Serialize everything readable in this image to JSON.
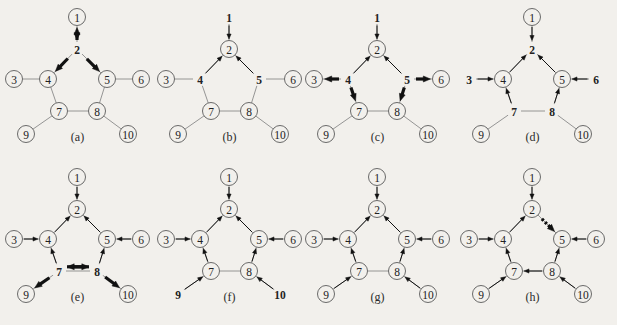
{
  "figure": {
    "title": "",
    "background_color": "#f2f0ec",
    "edge_color": "#8a8a8a",
    "arrow_color": "#111111",
    "node_stroke_color": "#5a5a5a",
    "panel_count": 8,
    "node_labels": [
      "1",
      "2",
      "3",
      "4",
      "5",
      "6",
      "7",
      "8",
      "9",
      "10"
    ],
    "base_edges": [
      "1-2",
      "2-4",
      "2-5",
      "3-4",
      "4-5 (via 7-8 path)",
      "5-6",
      "4-7",
      "5-8",
      "7-8",
      "7-9",
      "8-10"
    ]
  },
  "panels": [
    {
      "caption": "(a)",
      "circled_nodes": [
        "1",
        "3",
        "4",
        "5",
        "6",
        "7",
        "8",
        "9",
        "10"
      ],
      "bare_nodes": [
        "2"
      ],
      "arrows": [
        {
          "from": "2",
          "to": "1",
          "style": "bold",
          "double": true,
          "note": "double-headed bold arrow on edge 1-2"
        },
        {
          "from": "2",
          "to": "4",
          "style": "bold",
          "double": false
        },
        {
          "from": "2",
          "to": "5",
          "style": "bold",
          "double": false
        }
      ]
    },
    {
      "caption": "(b)",
      "circled_nodes": [
        "2",
        "3",
        "6",
        "7",
        "8",
        "9",
        "10"
      ],
      "bare_nodes": [
        "1",
        "4",
        "5"
      ],
      "arrows": [
        {
          "from": "1",
          "to": "2",
          "style": "thin",
          "double": false
        },
        {
          "from": "4",
          "to": "2",
          "style": "thin",
          "double": false
        },
        {
          "from": "5",
          "to": "2",
          "style": "thin",
          "double": false
        }
      ]
    },
    {
      "caption": "(c)",
      "circled_nodes": [
        "2",
        "3",
        "6",
        "7",
        "8",
        "9",
        "10"
      ],
      "bare_nodes": [
        "1",
        "4",
        "5"
      ],
      "arrows": [
        {
          "from": "1",
          "to": "2",
          "style": "thin",
          "double": false
        },
        {
          "from": "4",
          "to": "2",
          "style": "thin",
          "double": false
        },
        {
          "from": "5",
          "to": "2",
          "style": "thin",
          "double": false
        },
        {
          "from": "4",
          "to": "3",
          "style": "bold",
          "double": false
        },
        {
          "from": "5",
          "to": "6",
          "style": "bold",
          "double": false
        },
        {
          "from": "4",
          "to": "7",
          "style": "bold",
          "double": false
        },
        {
          "from": "5",
          "to": "8",
          "style": "bold",
          "double": false
        }
      ]
    },
    {
      "caption": "(d)",
      "circled_nodes": [
        "1",
        "4",
        "5",
        "9",
        "10"
      ],
      "bare_nodes": [
        "2",
        "3",
        "6",
        "7",
        "8"
      ],
      "arrows": [
        {
          "from": "1",
          "to": "2",
          "style": "thin",
          "double": false
        },
        {
          "from": "4",
          "to": "2",
          "style": "thin",
          "double": false
        },
        {
          "from": "5",
          "to": "2",
          "style": "thin",
          "double": false
        },
        {
          "from": "3",
          "to": "4",
          "style": "thin",
          "double": false
        },
        {
          "from": "6",
          "to": "5",
          "style": "thin",
          "double": false
        },
        {
          "from": "7",
          "to": "4",
          "style": "thin",
          "double": false
        },
        {
          "from": "8",
          "to": "5",
          "style": "thin",
          "double": false
        }
      ]
    },
    {
      "caption": "(e)",
      "circled_nodes": [
        "1",
        "2",
        "3",
        "4",
        "5",
        "6",
        "9",
        "10"
      ],
      "bare_nodes": [
        "7",
        "8"
      ],
      "arrows": [
        {
          "from": "1",
          "to": "2",
          "style": "thin",
          "double": false
        },
        {
          "from": "4",
          "to": "2",
          "style": "thin",
          "double": false
        },
        {
          "from": "5",
          "to": "2",
          "style": "thin",
          "double": false
        },
        {
          "from": "3",
          "to": "4",
          "style": "thin",
          "double": false
        },
        {
          "from": "6",
          "to": "5",
          "style": "thin",
          "double": false
        },
        {
          "from": "7",
          "to": "4",
          "style": "thin",
          "double": false
        },
        {
          "from": "8",
          "to": "5",
          "style": "thin",
          "double": false
        },
        {
          "from": "7",
          "to": "8",
          "style": "bold",
          "double": false,
          "note": "upper parallel arrow pointing right"
        },
        {
          "from": "8",
          "to": "7",
          "style": "bold",
          "double": false,
          "note": "lower parallel arrow pointing left"
        },
        {
          "from": "7",
          "to": "9",
          "style": "bold",
          "double": false
        },
        {
          "from": "8",
          "to": "10",
          "style": "bold",
          "double": false
        }
      ]
    },
    {
      "caption": "(f)",
      "circled_nodes": [
        "1",
        "2",
        "3",
        "4",
        "5",
        "6",
        "7",
        "8"
      ],
      "bare_nodes": [
        "9",
        "10"
      ],
      "arrows": [
        {
          "from": "1",
          "to": "2",
          "style": "thin",
          "double": false
        },
        {
          "from": "4",
          "to": "2",
          "style": "thin",
          "double": false
        },
        {
          "from": "5",
          "to": "2",
          "style": "thin",
          "double": false
        },
        {
          "from": "3",
          "to": "4",
          "style": "thin",
          "double": false
        },
        {
          "from": "6",
          "to": "5",
          "style": "thin",
          "double": false
        },
        {
          "from": "7",
          "to": "4",
          "style": "thin",
          "double": false
        },
        {
          "from": "8",
          "to": "5",
          "style": "thin",
          "double": false
        },
        {
          "from": "9",
          "to": "7",
          "style": "thin",
          "double": false
        },
        {
          "from": "10",
          "to": "8",
          "style": "thin",
          "double": false
        }
      ]
    },
    {
      "caption": "(g)",
      "circled_nodes": [
        "1",
        "2",
        "3",
        "4",
        "5",
        "6",
        "7",
        "8",
        "9",
        "10"
      ],
      "bare_nodes": [],
      "arrows": [
        {
          "from": "1",
          "to": "2",
          "style": "thin",
          "double": false
        },
        {
          "from": "4",
          "to": "2",
          "style": "thin",
          "double": false
        },
        {
          "from": "5",
          "to": "2",
          "style": "thin",
          "double": false
        },
        {
          "from": "3",
          "to": "4",
          "style": "thin",
          "double": false
        },
        {
          "from": "6",
          "to": "5",
          "style": "thin",
          "double": false
        },
        {
          "from": "7",
          "to": "4",
          "style": "thin",
          "double": false
        },
        {
          "from": "8",
          "to": "5",
          "style": "thin",
          "double": false
        },
        {
          "from": "9",
          "to": "7",
          "style": "thin",
          "double": false
        },
        {
          "from": "10",
          "to": "8",
          "style": "thin",
          "double": false
        }
      ]
    },
    {
      "caption": "(h)",
      "circled_nodes": [
        "1",
        "2",
        "3",
        "4",
        "5",
        "6",
        "7",
        "8",
        "9",
        "10"
      ],
      "bare_nodes": [],
      "arrows": [
        {
          "from": "1",
          "to": "2",
          "style": "thin",
          "double": false
        },
        {
          "from": "4",
          "to": "2",
          "style": "thin",
          "double": false
        },
        {
          "from": "2",
          "to": "5",
          "style": "bold-dashed",
          "double": false,
          "note": "bold dashed arrow from 2 down to 5"
        },
        {
          "from": "3",
          "to": "4",
          "style": "thin",
          "double": false
        },
        {
          "from": "6",
          "to": "5",
          "style": "thin",
          "double": false
        },
        {
          "from": "7",
          "to": "4",
          "style": "thin",
          "double": false
        },
        {
          "from": "8",
          "to": "5",
          "style": "thin",
          "double": false
        },
        {
          "from": "8",
          "to": "7",
          "style": "thin",
          "double": false,
          "note": "arrow along bottom edge pointing left"
        },
        {
          "from": "9",
          "to": "7",
          "style": "thin",
          "double": false
        },
        {
          "from": "10",
          "to": "8",
          "style": "thin",
          "double": false
        }
      ]
    }
  ]
}
